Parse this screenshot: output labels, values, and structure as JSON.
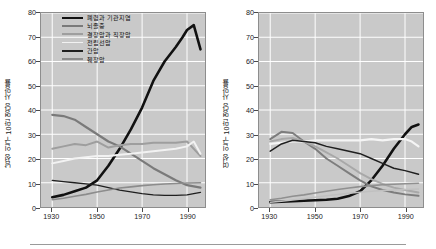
{
  "chart_data": [
    {
      "type": "line",
      "title": "",
      "panel": "left",
      "xlabel": "",
      "ylabel": "남성 인구 10만 명당 사망률",
      "xlim": [
        1925,
        1998
      ],
      "ylim": [
        0,
        80
      ],
      "xticks": [
        1930,
        1950,
        1970,
        1990
      ],
      "yticks": [
        0,
        10,
        20,
        30,
        40,
        50,
        60,
        70,
        80
      ],
      "grid": true,
      "legend_position": "top-center",
      "series": [
        {
          "name": "폐렴과 기관지염",
          "color": "#111111",
          "width": 2.6,
          "x": [
            1930,
            1935,
            1940,
            1945,
            1950,
            1955,
            1960,
            1965,
            1970,
            1975,
            1980,
            1985,
            1988,
            1990,
            1993,
            1996
          ],
          "values": [
            4,
            5,
            6.5,
            8,
            11,
            17,
            24,
            32,
            41,
            52,
            60,
            66,
            70,
            73,
            75,
            65
          ]
        },
        {
          "name": "뇌졸중",
          "color": "#7a7a7a",
          "width": 2.2,
          "x": [
            1930,
            1935,
            1940,
            1945,
            1950,
            1955,
            1960,
            1965,
            1970,
            1975,
            1980,
            1985,
            1990,
            1996
          ],
          "values": [
            38,
            37.5,
            36,
            33,
            30,
            27,
            25,
            22,
            19,
            16,
            13.5,
            11,
            9,
            8
          ]
        },
        {
          "name": "결장암과 직장암",
          "color": "#9e9e9e",
          "width": 2.0,
          "x": [
            1930,
            1935,
            1940,
            1945,
            1950,
            1955,
            1960,
            1965,
            1970,
            1975,
            1980,
            1985,
            1990,
            1996
          ],
          "values": [
            24,
            25,
            26,
            25.5,
            27,
            24.5,
            25.5,
            26,
            26,
            26.5,
            26.5,
            26.5,
            27,
            21
          ]
        },
        {
          "name": "전립선암",
          "color": "#f2f2f2",
          "width": 2.0,
          "x": [
            1930,
            1935,
            1940,
            1945,
            1950,
            1955,
            1960,
            1965,
            1970,
            1975,
            1980,
            1985,
            1990,
            1993,
            1996
          ],
          "values": [
            18,
            19,
            20,
            20.5,
            21,
            21,
            21.5,
            22,
            22.5,
            23,
            23.5,
            24,
            25,
            27,
            22
          ]
        },
        {
          "name": "간암",
          "color": "#1f1f1f",
          "width": 1.3,
          "x": [
            1930,
            1935,
            1940,
            1945,
            1950,
            1955,
            1960,
            1965,
            1970,
            1975,
            1980,
            1985,
            1990,
            1996
          ],
          "values": [
            11,
            10.5,
            10,
            9.5,
            9,
            8,
            7,
            6.2,
            5.5,
            5,
            4.8,
            4.8,
            5,
            6
          ]
        },
        {
          "name": "췌장암",
          "color": "#8c8c8c",
          "width": 1.6,
          "x": [
            1930,
            1935,
            1940,
            1945,
            1950,
            1955,
            1960,
            1965,
            1970,
            1975,
            1980,
            1985,
            1990,
            1996
          ],
          "values": [
            3,
            3.6,
            4.4,
            5.2,
            6.2,
            7,
            7.8,
            8.3,
            8.8,
            9.2,
            9.5,
            9.7,
            9.9,
            10
          ]
        }
      ]
    },
    {
      "type": "line",
      "title": "",
      "panel": "right",
      "xlabel": "",
      "ylabel": "여성 인구 10만 명당 사망률",
      "xlim": [
        1925,
        1998
      ],
      "ylim": [
        0,
        80
      ],
      "xticks": [
        1930,
        1950,
        1970,
        1990
      ],
      "yticks": [
        0,
        10,
        20,
        30,
        40,
        50,
        60,
        70,
        80
      ],
      "grid": true,
      "legend_position": "top-center",
      "series": [
        {
          "name": "폐렴과 기관지염",
          "color": "#111111",
          "width": 2.6,
          "x": [
            1930,
            1935,
            1940,
            1945,
            1950,
            1955,
            1960,
            1965,
            1970,
            1975,
            1980,
            1985,
            1990,
            1993,
            1996
          ],
          "values": [
            2,
            2.2,
            2.4,
            2.6,
            2.8,
            3,
            3.4,
            4.5,
            6.5,
            11,
            17,
            24,
            30,
            33,
            34
          ]
        },
        {
          "name": "위암",
          "color": "#7d7d7d",
          "width": 2.0,
          "x": [
            1930,
            1935,
            1940,
            1945,
            1950,
            1955,
            1960,
            1965,
            1970,
            1975,
            1980,
            1985,
            1990,
            1996
          ],
          "values": [
            28,
            31,
            30.5,
            27,
            24,
            20,
            17,
            14,
            11,
            8.5,
            7,
            6,
            5.2,
            4.6
          ]
        },
        {
          "name": "자궁암",
          "color": "#a8a8a8",
          "width": 2.0,
          "x": [
            1930,
            1935,
            1940,
            1945,
            1950,
            1955,
            1960,
            1965,
            1970,
            1975,
            1980,
            1985,
            1990,
            1996
          ],
          "values": [
            27,
            28,
            28.5,
            27,
            25,
            22.5,
            20,
            17,
            14,
            11.5,
            9.5,
            8,
            7,
            6
          ]
        },
        {
          "name": "유방암",
          "color": "#f5f5f5",
          "width": 2.2,
          "x": [
            1930,
            1935,
            1940,
            1945,
            1950,
            1955,
            1960,
            1965,
            1970,
            1975,
            1980,
            1985,
            1990,
            1993,
            1996
          ],
          "values": [
            26,
            26.5,
            27,
            27,
            27.5,
            27.5,
            27.5,
            27.5,
            27.5,
            28,
            27.5,
            28,
            28,
            27,
            25
          ]
        },
        {
          "name": "결장암과 직장암",
          "color": "#1f1f1f",
          "width": 1.5,
          "x": [
            1930,
            1935,
            1940,
            1945,
            1950,
            1955,
            1960,
            1965,
            1970,
            1975,
            1980,
            1985,
            1990,
            1996
          ],
          "values": [
            23,
            26,
            27.5,
            27,
            26.5,
            25,
            24,
            23,
            22,
            20,
            18,
            16,
            15,
            13.5
          ]
        },
        {
          "name": "난소암",
          "color": "#909090",
          "width": 1.6,
          "x": [
            1930,
            1935,
            1940,
            1945,
            1950,
            1955,
            1960,
            1965,
            1970,
            1975,
            1980,
            1985,
            1990,
            1996
          ],
          "values": [
            3,
            3.6,
            4.4,
            5,
            5.8,
            6.5,
            7.2,
            7.8,
            8.4,
            8.8,
            9.2,
            9.4,
            9.6,
            9.8
          ]
        },
        {
          "name": "췌장암",
          "color": "#c0c0c0",
          "width": 1.5,
          "x": [
            1930,
            1935,
            1940,
            1945,
            1950,
            1955,
            1960,
            1965,
            1970,
            1975,
            1980,
            1985,
            1990,
            1996
          ],
          "values": [
            2,
            2.4,
            2.9,
            3.4,
            4,
            4.6,
            5.2,
            5.7,
            6.1,
            6.5,
            6.8,
            7,
            7.2,
            7.4
          ]
        }
      ]
    }
  ]
}
